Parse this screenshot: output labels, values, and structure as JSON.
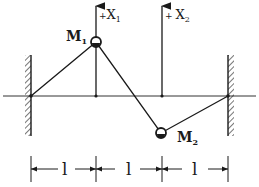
{
  "diagram": {
    "colors": {
      "ink": "#1a1a1a",
      "background": "#ffffff"
    },
    "axes": [
      {
        "id": "x1",
        "label_prefix": "+",
        "label": "X",
        "subscript": "1"
      },
      {
        "id": "x2",
        "label_prefix": "+",
        "label": "X",
        "subscript": "2"
      }
    ],
    "masses": [
      {
        "id": "m1",
        "label": "M",
        "subscript": "1",
        "displacement": "up"
      },
      {
        "id": "m2",
        "label": "M",
        "subscript": "2",
        "displacement": "down"
      }
    ],
    "walls": [
      {
        "id": "left-wall",
        "side": "left"
      },
      {
        "id": "right-wall",
        "side": "right"
      }
    ],
    "dimensions": [
      {
        "label": "l"
      },
      {
        "label": "l"
      },
      {
        "label": "l"
      }
    ]
  }
}
